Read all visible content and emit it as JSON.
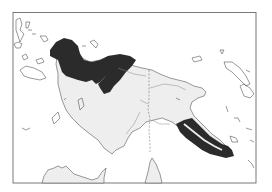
{
  "map": {
    "type": "distribution-range-map",
    "region": "New Guinea",
    "frame": {
      "x": 13,
      "y": 12,
      "width": 243,
      "height": 171,
      "stroke": "#6b6b6b"
    },
    "colors": {
      "background": "#ffffff",
      "land_fill": "#eeeeee",
      "coast_stroke": "#555555",
      "range_fill": "#2b2b2b",
      "border_stroke": "#777777"
    },
    "legend": [],
    "labels": []
  }
}
